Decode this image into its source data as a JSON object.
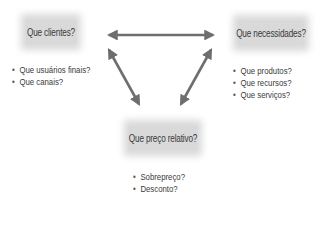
{
  "nodes": {
    "clients": {
      "title": "Que clientes?",
      "items": [
        "Que usuários finais?",
        "Que canais?"
      ]
    },
    "needs": {
      "title": "Que necessidades?",
      "items": [
        "Que produtos?",
        "Que recursos?",
        "Que serviços?"
      ]
    },
    "price": {
      "title": "Que preço relativo?",
      "items": [
        "Sobrepreço?",
        "Desconto?"
      ]
    }
  },
  "edges": [
    {
      "from": "clients",
      "to": "needs",
      "type": "bidirectional"
    },
    {
      "from": "clients",
      "to": "price",
      "type": "bidirectional"
    },
    {
      "from": "needs",
      "to": "price",
      "type": "bidirectional"
    }
  ],
  "colors": {
    "box_fill": "#d9d9d9",
    "arrow": "#6e6e6e",
    "text": "#3a3a3a"
  }
}
